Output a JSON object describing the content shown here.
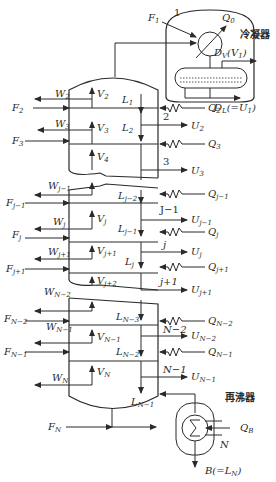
{
  "diagram": {
    "condenser_label": "冷凝器",
    "reboiler_label": "再沸器",
    "condenser": {
      "stage": "1",
      "feed": "F",
      "feed_sub": "1",
      "heat": "Q",
      "heat_sub": "0",
      "vapor_dist": "D",
      "vapor_dist_sub": "V",
      "vapor_dist_eq": "(V",
      "vapor_dist_eq_sub": "1",
      "vapor_dist_close": ")",
      "liquid_dist": "D",
      "liquid_dist_sub": "L",
      "liquid_dist_eq": "(=U",
      "liquid_dist_eq_sub": "1",
      "liquid_dist_close": ")"
    },
    "reboiler": {
      "stage": "N",
      "heat": "Q",
      "heat_sub": "B",
      "bottoms": "B(=L",
      "bottoms_sub": "N",
      "bottoms_close": ")",
      "feed": "F",
      "feed_sub": "N"
    },
    "left_streams": [
      {
        "w": "W",
        "w_sub": "2",
        "f": "F",
        "f_sub": "2"
      },
      {
        "w": "W",
        "w_sub": "3",
        "f": "F",
        "f_sub": "3"
      },
      {
        "w": "W",
        "w_sub": "j−1",
        "f": "F",
        "f_sub": "j−1"
      },
      {
        "w": "W",
        "w_sub": "j",
        "f": "F",
        "f_sub": "j"
      },
      {
        "w": "W",
        "w_sub": "j+1",
        "f": "F",
        "f_sub": "j+1"
      },
      {
        "w": "W",
        "w_sub": "N−2",
        "f": "F",
        "f_sub": "N−2"
      },
      {
        "w": "W",
        "w_sub": "N−1",
        "f": "F",
        "f_sub": "N−1"
      },
      {
        "w": "W",
        "w_sub": "N"
      }
    ],
    "vapors": [
      {
        "v": "V",
        "sub": "2"
      },
      {
        "v": "V",
        "sub": "3"
      },
      {
        "v": "V",
        "sub": "4"
      },
      {
        "v": "V",
        "sub": "j"
      },
      {
        "v": "V",
        "sub": "j+1"
      },
      {
        "v": "V",
        "sub": "j+2"
      },
      {
        "v": "V",
        "sub": "N−1"
      },
      {
        "v": "V",
        "sub": "N"
      }
    ],
    "liquids": [
      {
        "l": "L",
        "sub": "1"
      },
      {
        "l": "L",
        "sub": "2"
      },
      {
        "l": "L",
        "sub": "j−2"
      },
      {
        "l": "L",
        "sub": "j−1"
      },
      {
        "l": "L",
        "sub": "j"
      },
      {
        "l": "L",
        "sub": "N−3"
      },
      {
        "l": "L",
        "sub": "N−2"
      },
      {
        "l": "L",
        "sub": "N−1"
      }
    ],
    "stages": [
      "2",
      "3",
      "J−1",
      "j",
      "j+1",
      "N−2",
      "N−1"
    ],
    "right_streams": [
      {
        "q": "Q",
        "q_sub": "2"
      },
      {
        "u": "U",
        "u_sub": "2"
      },
      {
        "q": "Q",
        "q_sub": "3"
      },
      {
        "u": "U",
        "u_sub": "3"
      },
      {
        "q": "Q",
        "q_sub": "j−1"
      },
      {
        "u": "U",
        "u_sub": "j−1"
      },
      {
        "q": "Q",
        "q_sub": "j"
      },
      {
        "u": "U",
        "u_sub": "j"
      },
      {
        "q": "Q",
        "q_sub": "j+1"
      },
      {
        "u": "U",
        "u_sub": "j+1"
      },
      {
        "q": "Q",
        "q_sub": "N−2"
      },
      {
        "u": "U",
        "u_sub": "N−2"
      },
      {
        "q": "Q",
        "q_sub": "N−1"
      },
      {
        "u": "U",
        "u_sub": "N−1"
      }
    ]
  }
}
